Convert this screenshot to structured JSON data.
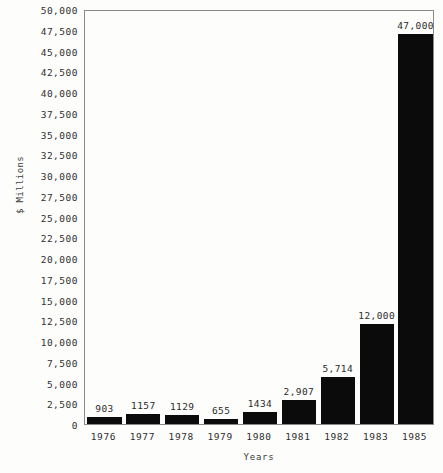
{
  "chart_data": {
    "type": "bar",
    "title": "",
    "xlabel": "Years",
    "ylabel": "$ Millions",
    "categories": [
      "1976",
      "1977",
      "1978",
      "1979",
      "1980",
      "1981",
      "1982",
      "1983",
      "1985"
    ],
    "values": [
      903,
      1157,
      1129,
      655,
      1434,
      2907,
      5714,
      12000,
      47000
    ],
    "point_labels": [
      "903",
      "1157",
      "1129",
      "655",
      "1434",
      "2,907",
      "5,714",
      "12,000",
      "47,000"
    ],
    "ylim": [
      0,
      50000
    ],
    "ytick_step": 2500,
    "ytick_labels": [
      "50,000",
      "47,500",
      "45,000",
      "42,500",
      "40,000",
      "37,500",
      "35,000",
      "32,500",
      "30,000",
      "27,500",
      "25,000",
      "22,500",
      "20,000",
      "17,500",
      "15,000",
      "12,500",
      "10,000",
      "7,500",
      "5,000",
      "2,500",
      "0"
    ],
    "ytick_values": [
      50000,
      47500,
      45000,
      42500,
      40000,
      37500,
      35000,
      32500,
      30000,
      27500,
      25000,
      22500,
      20000,
      17500,
      15000,
      12500,
      10000,
      7500,
      5000,
      2500,
      0
    ],
    "grid": false,
    "legend": false,
    "bar_color": "#0b0b0b",
    "background_color": "#fdfdfc",
    "axis_color": "#8a8a8a"
  }
}
